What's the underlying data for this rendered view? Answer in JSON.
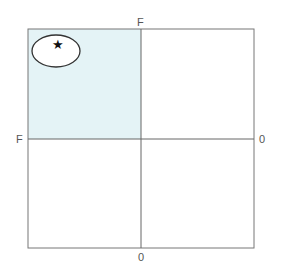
{
  "diagram": {
    "type": "quadrant grid",
    "labels": {
      "top": "F",
      "left": "F",
      "right": "0",
      "bottom": "0"
    },
    "highlighted_quadrant": "top-left",
    "highlight_color": "#e4f3f6",
    "marker": {
      "shape": "star",
      "glyph": "★",
      "enclosed_by": "ellipse",
      "quadrant": "top-left"
    }
  }
}
